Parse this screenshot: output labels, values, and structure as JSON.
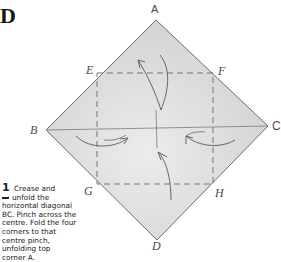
{
  "diagram": {
    "step_letter": "D",
    "points": {
      "A": "A",
      "B": "B",
      "C": "C",
      "D": "D",
      "E": "E",
      "F": "F",
      "G": "G",
      "H": "H"
    },
    "instruction": {
      "number": "1",
      "lines": [
        "Crease and",
        "unfold the",
        "horizontal diagonal",
        "BC. Pinch across the",
        "centre. Fold the four",
        "corners to that",
        "centre pinch,",
        "unfolding top",
        "corner A."
      ]
    },
    "colors": {
      "paper_fill": "#d9d9d9",
      "outline": "#6e6e6e",
      "crease": "#6a6a6a",
      "text": "#222222"
    }
  }
}
